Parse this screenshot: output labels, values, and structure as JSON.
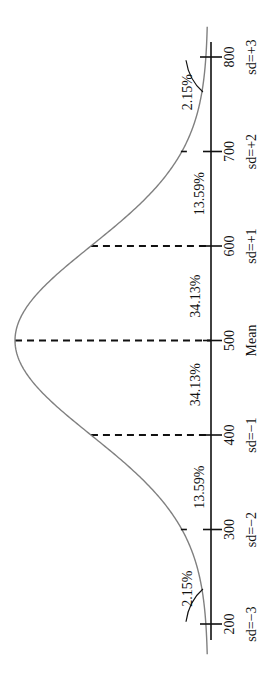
{
  "chart_data": {
    "type": "line",
    "title": "",
    "subtitle": "",
    "orientation": "rotated-90-counterclockwise",
    "distribution": "normal",
    "mean": 500,
    "sd": 100,
    "xlabel": "",
    "ylabel": "",
    "xlim": [
      200,
      800
    ],
    "grid": false,
    "legend": "none",
    "ticks": [
      {
        "value": 200,
        "label": "200",
        "sd_label": "sd=−3"
      },
      {
        "value": 300,
        "label": "300",
        "sd_label": "sd=−2"
      },
      {
        "value": 400,
        "label": "400",
        "sd_label": "sd=−1"
      },
      {
        "value": 500,
        "label": "500",
        "sd_label": "Mean"
      },
      {
        "value": 600,
        "label": "600",
        "sd_label": "sd=+1"
      },
      {
        "value": 700,
        "label": "700",
        "sd_label": "sd=+2"
      },
      {
        "value": 800,
        "label": "800",
        "sd_label": "sd=+3"
      }
    ],
    "dashed_lines_at": [
      400,
      500,
      600
    ],
    "regions": [
      {
        "from": 200,
        "to": 300,
        "percent": 2.15,
        "label": "2.15%",
        "has_leader": true
      },
      {
        "from": 300,
        "to": 400,
        "percent": 13.59,
        "label": "13.59%",
        "has_leader": false
      },
      {
        "from": 400,
        "to": 500,
        "percent": 34.13,
        "label": "34.13%",
        "has_leader": false
      },
      {
        "from": 500,
        "to": 600,
        "percent": 34.13,
        "label": "34.13%",
        "has_leader": false
      },
      {
        "from": 600,
        "to": 700,
        "percent": 13.59,
        "label": "13.59%",
        "has_leader": false
      },
      {
        "from": 700,
        "to": 800,
        "percent": 2.15,
        "label": "2.15%",
        "has_leader": true
      }
    ],
    "colors": {
      "curve": "#808080",
      "axis": "#111111",
      "text": "#111111"
    }
  }
}
